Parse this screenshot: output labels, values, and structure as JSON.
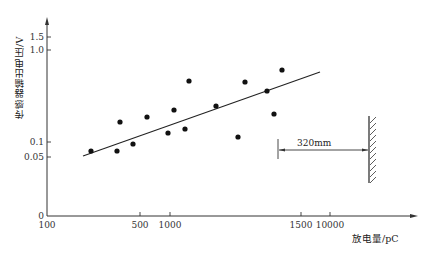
{
  "chart_data": {
    "type": "scatter",
    "title": "",
    "xlabel": "放电量/pC",
    "ylabel": "传感器输出电压/V",
    "x_ticks": [
      {
        "label": "100",
        "px": 47
      },
      {
        "label": "500",
        "px": 140
      },
      {
        "label": "1000",
        "px": 170
      },
      {
        "label": "1500",
        "px": 301
      },
      {
        "label": "10000",
        "px": 330
      }
    ],
    "y_ticks": [
      {
        "label": "0",
        "px": 216
      },
      {
        "label": "0.05",
        "px": 157
      },
      {
        "label": "0.1",
        "px": 142
      },
      {
        "label": "1.0",
        "px": 50
      },
      {
        "label": "1.5",
        "px": 37
      }
    ],
    "grid": false,
    "legend": null,
    "series": [
      {
        "name": "measured",
        "points": [
          {
            "x": 230,
            "y": 0.07,
            "px": [
              91,
              151
            ]
          },
          {
            "x": 370,
            "y": 0.07,
            "px": [
              117,
              151
            ]
          },
          {
            "x": 390,
            "y": 0.165,
            "px": [
              120,
              122
            ]
          },
          {
            "x": 475,
            "y": 0.095,
            "px": [
              133,
              144
            ]
          },
          {
            "x": 650,
            "y": 0.185,
            "px": [
              147,
              117
            ]
          },
          {
            "x": 960,
            "y": 0.125,
            "px": [
              168,
              133
            ]
          },
          {
            "x": 1050,
            "y": 0.22,
            "px": [
              174,
              110
            ]
          },
          {
            "x": 1060,
            "y": 0.14,
            "px": [
              185,
              129
            ]
          },
          {
            "x": 1090,
            "y": 0.46,
            "px": [
              189,
              81
            ]
          },
          {
            "x": 1200,
            "y": 0.25,
            "px": [
              216,
              106
            ]
          },
          {
            "x": 1290,
            "y": 0.11,
            "px": [
              238,
              137
            ]
          },
          {
            "x": 1315,
            "y": 0.45,
            "px": [
              245,
              82
            ]
          },
          {
            "x": 1400,
            "y": 0.36,
            "px": [
              267,
              91
            ]
          },
          {
            "x": 1425,
            "y": 0.2,
            "px": [
              274,
              114
            ]
          },
          {
            "x": 1460,
            "y": 0.6,
            "px": [
              282,
              70
            ]
          }
        ]
      }
    ],
    "fit_line": {
      "from_px": [
        83,
        156
      ],
      "to_px": [
        320,
        72
      ]
    },
    "annotations": [
      {
        "text": "320mm",
        "type": "dimension",
        "from_px": [
          278,
          150
        ],
        "to_px": [
          369,
          150
        ]
      }
    ]
  },
  "labels": {
    "ylabel": "传感器输出电压/V",
    "xlabel": "放电量/pC",
    "dimension": "320mm"
  }
}
